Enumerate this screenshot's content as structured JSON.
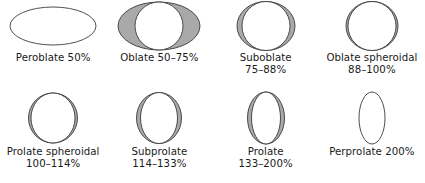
{
  "figure": {
    "background_color": "#ffffff",
    "outline_color": "#3b3b3b",
    "fill_color": "#ffffff",
    "reference_color": "#a9a9a9",
    "text_color": "#1a1a1a"
  },
  "rows": [
    {
      "items": [
        {
          "name": "peroblate",
          "label_line1": "Peroblate 50%",
          "label_line2": "",
          "ellipse": {
            "rx": 43,
            "ry": 19
          },
          "reference": null
        },
        {
          "name": "oblate",
          "label_line1": "Oblate 50–75%",
          "label_line2": "",
          "ellipse": {
            "rx": 24,
            "ry": 24
          },
          "reference": {
            "rx": 41,
            "ry": 24
          }
        },
        {
          "name": "suboblate",
          "label_line1": "Suboblate",
          "label_line2": "75–88%",
          "ellipse": {
            "rx": 24,
            "ry": 24.5
          },
          "reference": {
            "rx": 29,
            "ry": 24.5
          }
        },
        {
          "name": "oblate-spheroidal",
          "label_line1": "Oblate spheroidal",
          "label_line2": "88–100%",
          "ellipse": {
            "rx": 24,
            "ry": 24.5
          },
          "reference": {
            "rx": 26,
            "ry": 24.5
          }
        }
      ]
    },
    {
      "items": [
        {
          "name": "prolate-spheroidal",
          "label_line1": "Prolate spheroidal",
          "label_line2": "100–114%",
          "ellipse": {
            "rx": 22,
            "ry": 25
          },
          "reference": {
            "rx": 24.5,
            "ry": 25
          }
        },
        {
          "name": "subprolate",
          "label_line1": "Subprolate",
          "label_line2": "114–133%",
          "ellipse": {
            "rx": 18.5,
            "ry": 25.5
          },
          "reference": {
            "rx": 22.5,
            "ry": 25.5
          }
        },
        {
          "name": "prolate",
          "label_line1": "Prolate",
          "label_line2": "133–200%",
          "ellipse": {
            "rx": 14.5,
            "ry": 26
          },
          "reference": {
            "rx": 18.5,
            "ry": 26
          }
        },
        {
          "name": "perprolate",
          "label_line1": "Perprolate 200%",
          "label_line2": "",
          "ellipse": {
            "rx": 13,
            "ry": 26
          },
          "reference": null
        }
      ]
    }
  ]
}
